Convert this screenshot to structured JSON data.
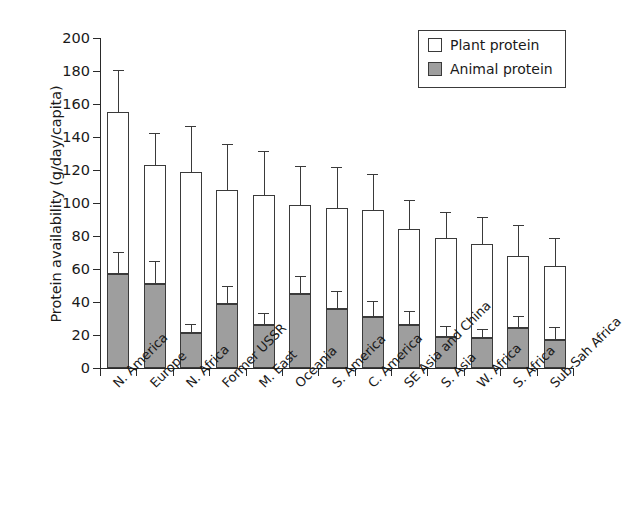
{
  "chart_data": {
    "type": "bar",
    "stacked": true,
    "title": "",
    "xlabel": "",
    "ylabel": "Protein availability (g/day/capita)",
    "ylim": [
      0,
      200
    ],
    "yticks": [
      0,
      20,
      40,
      60,
      80,
      100,
      120,
      140,
      160,
      180,
      200
    ],
    "grid": false,
    "legend_position": "top-right",
    "categories": [
      "N. America",
      "Europe",
      "N. Africa",
      "Former USSR",
      "M. East",
      "Oceania",
      "S. America",
      "C. America",
      "SE Asia and China",
      "S. Asia",
      "W. Africa",
      "S. Africa",
      "Sub-Sah Africa"
    ],
    "series": [
      {
        "name": "Animal protein",
        "color": "#9e9e9e",
        "values": [
          57,
          51,
          21,
          39,
          26,
          45,
          36,
          31,
          26,
          19,
          18,
          24,
          17
        ],
        "errors_upper": [
          70,
          64,
          26,
          49,
          33,
          55,
          46,
          40,
          34,
          25,
          23,
          31,
          24
        ]
      },
      {
        "name": "Plant protein",
        "color": "#ffffff",
        "values": [
          98,
          72,
          98,
          69,
          79,
          54,
          61,
          65,
          58,
          60,
          57,
          44,
          45
        ],
        "totals": [
          155,
          123,
          119,
          108,
          105,
          99,
          97,
          96,
          84,
          79,
          75,
          68,
          62
        ],
        "errors_upper": [
          180,
          142,
          146,
          135,
          131,
          122,
          121,
          117,
          101,
          94,
          91,
          86,
          78
        ]
      }
    ]
  },
  "legend": {
    "entries": [
      {
        "label": "Plant protein",
        "swatch": "plant"
      },
      {
        "label": "Animal protein",
        "swatch": "animal"
      }
    ]
  },
  "axis": {
    "y_title": "Protein availability (g/day/capita)"
  }
}
